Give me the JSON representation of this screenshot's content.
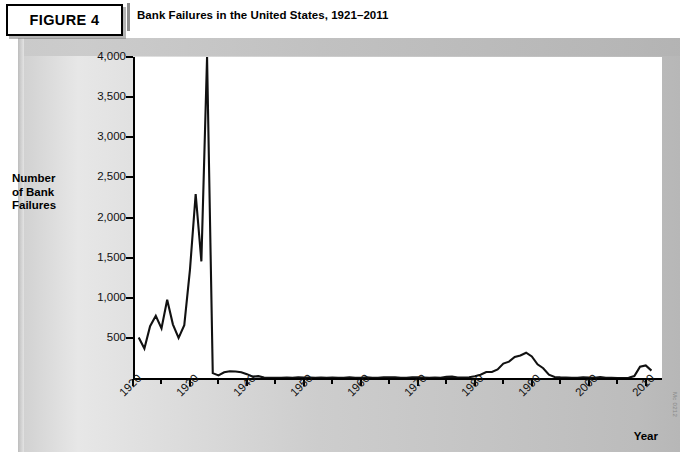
{
  "figure": {
    "badge_label": "FIGURE 4",
    "title": "Bank Failures in the United States, 1921–2011",
    "source_credit": "Mc 0212"
  },
  "axes": {
    "y_axis_title": "Number\nof Bank\nFailures",
    "y_axis_title_lines": [
      "Number",
      "of Bank",
      "Failures"
    ],
    "x_axis_title": "Year",
    "y_tick_labels": [
      "500",
      "1,000",
      "1,500",
      "2,000",
      "2,500",
      "3,000",
      "3,500",
      "4,000"
    ],
    "x_tick_labels": [
      "1920",
      "1930",
      "1940",
      "1950",
      "1960",
      "1970",
      "1980",
      "1990",
      "2000",
      "2010"
    ]
  },
  "colors": {
    "line": "#111111",
    "axis": "#000000",
    "plot_background": "#ffffff",
    "panel_light": "#e7e7e7",
    "panel_dark": "#b7b7b7"
  },
  "chart_data": {
    "type": "line",
    "title": "Bank Failures in the United States, 1921–2011",
    "xlabel": "Year",
    "ylabel": "Number of Bank Failures",
    "xlim": [
      1921,
      2011
    ],
    "ylim": [
      0,
      4000
    ],
    "ytick_values": [
      500,
      1000,
      1500,
      2000,
      2500,
      3000,
      3500,
      4000
    ],
    "xtick_values": [
      1920,
      1930,
      1940,
      1950,
      1960,
      1970,
      1980,
      1990,
      2000,
      2010
    ],
    "grid": false,
    "legend": "none",
    "note": "1933 value is clipped at the top of the scale (4,000)",
    "series": [
      {
        "name": "Number of Bank Failures",
        "x": [
          1921,
          1922,
          1923,
          1924,
          1925,
          1926,
          1927,
          1928,
          1929,
          1930,
          1931,
          1932,
          1933,
          1934,
          1935,
          1936,
          1937,
          1938,
          1939,
          1940,
          1941,
          1942,
          1943,
          1944,
          1945,
          1946,
          1947,
          1948,
          1949,
          1950,
          1951,
          1952,
          1953,
          1954,
          1955,
          1956,
          1957,
          1958,
          1959,
          1960,
          1961,
          1962,
          1963,
          1964,
          1965,
          1966,
          1967,
          1968,
          1969,
          1970,
          1971,
          1972,
          1973,
          1974,
          1975,
          1976,
          1977,
          1978,
          1979,
          1980,
          1981,
          1982,
          1983,
          1984,
          1985,
          1986,
          1987,
          1988,
          1989,
          1990,
          1991,
          1992,
          1993,
          1994,
          1995,
          1996,
          1997,
          1998,
          1999,
          2000,
          2001,
          2002,
          2003,
          2004,
          2005,
          2006,
          2007,
          2008,
          2009,
          2010,
          2011
        ],
        "y": [
          505,
          367,
          646,
          775,
          618,
          976,
          669,
          499,
          659,
          1350,
          2293,
          1453,
          4000,
          61,
          32,
          72,
          84,
          81,
          72,
          48,
          17,
          23,
          5,
          2,
          1,
          1,
          6,
          3,
          9,
          5,
          5,
          4,
          5,
          4,
          5,
          3,
          3,
          9,
          3,
          2,
          9,
          3,
          2,
          8,
          9,
          8,
          4,
          3,
          9,
          8,
          6,
          3,
          6,
          4,
          14,
          17,
          6,
          7,
          10,
          22,
          40,
          74,
          75,
          106,
          180,
          204,
          262,
          280,
          315,
          268,
          171,
          122,
          41,
          13,
          8,
          6,
          1,
          3,
          8,
          7,
          4,
          11,
          3,
          4,
          0,
          0,
          3,
          25,
          140,
          157,
          92
        ]
      }
    ]
  }
}
